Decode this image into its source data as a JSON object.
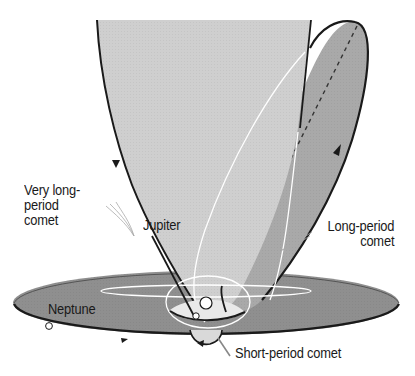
{
  "diagram": {
    "colors": {
      "background": "#ffffff",
      "very_long_period_fill": "#cfcfcf",
      "long_period_fill": "#a9a9a9",
      "ecliptic_fill": "#8f8f8f",
      "orbit_line": "#1a1a1a",
      "highlight_line": "#ffffff"
    },
    "labels": {
      "very_long_period": "Very long-\nperiod\ncomet",
      "jupiter": "Jupiter",
      "long_period": "Long-period\ncomet",
      "neptune": "Neptune",
      "short_period": "Short-period comet"
    },
    "bodies": [
      {
        "name": "Sun",
        "shape": "circle-outline"
      },
      {
        "name": "Jupiter",
        "shape": "small-dot"
      },
      {
        "name": "Neptune",
        "shape": "small-dot"
      }
    ],
    "orbits": [
      {
        "name": "Very long-period comet",
        "type": "parabola"
      },
      {
        "name": "Long-period comet",
        "type": "tilted-ellipse",
        "axis": "dashed"
      },
      {
        "name": "Short-period comet",
        "type": "small-ellipse"
      },
      {
        "name": "Neptune orbit",
        "type": "ecliptic-ellipse"
      },
      {
        "name": "Jupiter orbit",
        "type": "ecliptic-ellipse"
      }
    ]
  }
}
